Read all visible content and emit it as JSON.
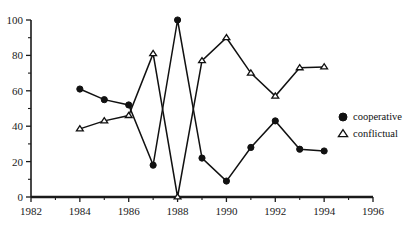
{
  "chart_data": {
    "type": "line",
    "title": "",
    "subtitle": "",
    "xlabel": "",
    "ylabel": "",
    "xlim": [
      1982,
      1996
    ],
    "ylim": [
      0,
      100
    ],
    "x": [
      1984,
      1985,
      1986,
      1987,
      1988,
      1989,
      1990,
      1991,
      1992,
      1993,
      1994
    ],
    "grid": false,
    "legend_position": "right",
    "x_tick_labels": [
      "1982",
      "1984",
      "1986",
      "1988",
      "1990",
      "1992",
      "1994",
      "1996"
    ],
    "x_tick_values": [
      1982,
      1984,
      1986,
      1988,
      1990,
      1992,
      1994,
      1996
    ],
    "x_minor_step": 1,
    "y_tick_labels": [
      "0",
      "20",
      "40",
      "60",
      "80",
      "100"
    ],
    "y_tick_values": [
      0,
      20,
      40,
      60,
      80,
      100
    ],
    "y_minor_step": 10,
    "series": [
      {
        "name": "cooperative",
        "marker": "filled-circle",
        "values": [
          61,
          55,
          52,
          18,
          100,
          22,
          9,
          28,
          43,
          27,
          26
        ]
      },
      {
        "name": "conflictual",
        "marker": "open-triangle",
        "values": [
          38.5,
          43,
          46,
          81,
          0,
          77,
          90,
          70,
          57,
          73,
          73.5
        ]
      }
    ]
  },
  "legend": {
    "entries": [
      {
        "label": "cooperative",
        "marker": "filled-circle"
      },
      {
        "label": "conflictual",
        "marker": "open-triangle"
      }
    ]
  },
  "colors": {
    "ink": "#111111",
    "axis": "#1a1a1a",
    "background": "#ffffff"
  }
}
